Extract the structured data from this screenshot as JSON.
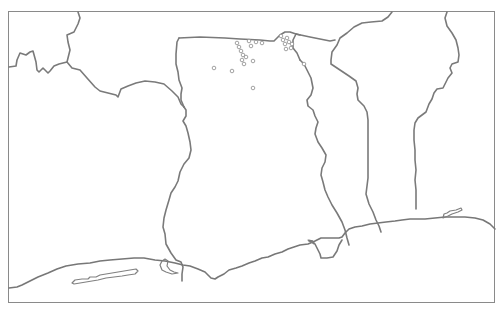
{
  "map": {
    "region": "Ghana and neighbouring West African coast",
    "colors": {
      "background": "#ffffff",
      "border_line": "#7a7a7a",
      "frame": "#8a8a8a",
      "marker_stroke": "#8c8c8c",
      "marker_fill": "#ffffff"
    },
    "frame": {
      "x": 8,
      "y": 11,
      "width": 487,
      "height": 292
    },
    "countries": [
      {
        "name": "cote-divoire",
        "visible": "partial-west"
      },
      {
        "name": "burkina-faso",
        "visible": "partial-north"
      },
      {
        "name": "ghana",
        "visible": "full"
      },
      {
        "name": "togo",
        "visible": "full"
      },
      {
        "name": "benin",
        "visible": "full"
      },
      {
        "name": "nigeria",
        "visible": "partial-east"
      }
    ],
    "markers": {
      "shape": "open-circle",
      "radius": 1.8,
      "points": [
        [
          214,
          68
        ],
        [
          232,
          71
        ],
        [
          237,
          43
        ],
        [
          239,
          47
        ],
        [
          241,
          51
        ],
        [
          243,
          55
        ],
        [
          242,
          60
        ],
        [
          244,
          64
        ],
        [
          246,
          57
        ],
        [
          249,
          41
        ],
        [
          253,
          61
        ],
        [
          253,
          88
        ],
        [
          256,
          42
        ],
        [
          262,
          43
        ],
        [
          251,
          46
        ],
        [
          281,
          36
        ],
        [
          283,
          40
        ],
        [
          285,
          44
        ],
        [
          287,
          38
        ],
        [
          289,
          42
        ],
        [
          286,
          49
        ],
        [
          291,
          48
        ],
        [
          292,
          44
        ],
        [
          304,
          64
        ]
      ]
    }
  }
}
